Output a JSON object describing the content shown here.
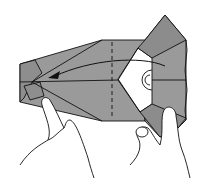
{
  "diagram": {
    "type": "origami-folding-step",
    "colors": {
      "paper_gray": "#9a9a9a",
      "paper_white": "#ffffff",
      "outline": "#111111",
      "background": "#ffffff"
    },
    "elements": [
      "paper-model",
      "fold-arrow",
      "valley-fold-line",
      "left-hand",
      "right-hand"
    ]
  }
}
